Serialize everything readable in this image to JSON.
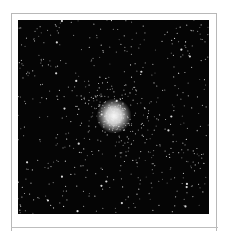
{
  "figure": {
    "caption": "",
    "image": {
      "background_color": "#050505",
      "star_color": "#e8e8e8",
      "core_color": "#f4f4f4",
      "width": 191,
      "height": 194,
      "core_center": [
        96,
        96
      ],
      "core_radius": 11,
      "halo_radius": 40,
      "field_star_count": 520,
      "halo_star_count": 260,
      "seed": 7
    },
    "frame_color": "#b8b8b8"
  }
}
